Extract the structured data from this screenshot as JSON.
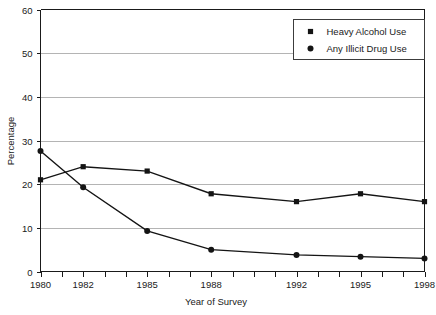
{
  "chart_data": {
    "type": "line",
    "title": "",
    "xlabel": "Year of Survey",
    "ylabel": "Percentage",
    "x": [
      1980,
      1982,
      1985,
      1988,
      1992,
      1995,
      1998
    ],
    "categories": [
      "1980",
      "1982",
      "1985",
      "1988",
      "1992",
      "1995",
      "1998"
    ],
    "xlim": [
      1980,
      1998
    ],
    "ylim": [
      0,
      60
    ],
    "ytick_values": [
      0,
      10,
      20,
      30,
      40,
      50,
      60
    ],
    "ytick_labels": [
      "0",
      "10",
      "20",
      "30",
      "40",
      "50",
      "60"
    ],
    "xtick_values": [
      1980,
      1981,
      1982,
      1983,
      1984,
      1985,
      1986,
      1987,
      1988,
      1989,
      1990,
      1991,
      1992,
      1993,
      1994,
      1995,
      1996,
      1997,
      1998
    ],
    "grid": "horizontal",
    "legend_position": "top-right",
    "series": [
      {
        "name": "Heavy Alcohol Use",
        "marker": "square",
        "values": [
          21.0,
          24.0,
          23.0,
          17.8,
          16.0,
          17.8,
          16.0
        ]
      },
      {
        "name": "Any Illicit Drug Use",
        "marker": "circle",
        "values": [
          27.6,
          19.3,
          9.3,
          5.0,
          3.8,
          3.4,
          3.0
        ]
      }
    ]
  },
  "legend": {
    "items": [
      {
        "label": "Heavy Alcohol Use",
        "marker": "square"
      },
      {
        "label": "Any Illicit Drug Use",
        "marker": "circle"
      }
    ]
  },
  "axes": {
    "y_title": "Percentage",
    "x_title": "Year of Survey",
    "y_labels": [
      "60",
      "50",
      "40",
      "30",
      "20",
      "10",
      "0"
    ],
    "x_labels": [
      "1980",
      "1982",
      "1985",
      "1988",
      "1992",
      "1995",
      "1998"
    ]
  },
  "colors": {
    "line": "#141414",
    "grid": "#b4b4b4",
    "axis": "#1a1a1a",
    "background": "#ffffff"
  }
}
